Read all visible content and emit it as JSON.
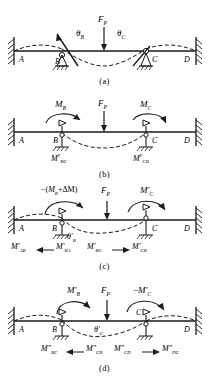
{
  "figure": {
    "stroke_color": "#1a1a1a",
    "dashed_color": "#1a1a1a"
  },
  "panels": [
    {
      "id": "a",
      "caption": "(a)",
      "nodes": [
        "A",
        "B",
        "C",
        "D"
      ],
      "load_label": "F",
      "load_sub": "P",
      "angles": [
        {
          "symbol": "θ",
          "sub": "B"
        },
        {
          "symbol": "θ",
          "sub": "C"
        }
      ],
      "supports": [
        "fixed-wall",
        "roller-pin",
        "roller-pin",
        "fixed-wall"
      ]
    },
    {
      "id": "b",
      "caption": "(b)",
      "nodes": [
        "A",
        "B",
        "C",
        "D"
      ],
      "load_label": "F",
      "load_sub": "P",
      "moments_top": [
        {
          "base": "M",
          "sub": "B"
        },
        {
          "base": "M",
          "sub": "C"
        }
      ],
      "moments_bottom": [
        {
          "base": "M",
          "sub": "BC",
          "sup": "F"
        },
        {
          "base": "M",
          "sub": "CB",
          "sup": "F"
        }
      ],
      "supports": [
        "fixed-wall",
        "clamped-pin",
        "clamped-pin",
        "fixed-wall"
      ]
    },
    {
      "id": "c",
      "caption": "(c)",
      "nodes": [
        "A",
        "B",
        "C",
        "D"
      ],
      "load_label": "F",
      "load_sub": "P",
      "moment_release_label": "−(M",
      "moment_release_sub": "B",
      "moment_release_mid": "+ΔM)",
      "moment_right": {
        "base": "M",
        "prime": "′",
        "sub": "C"
      },
      "angle": {
        "symbol": "θ",
        "prime": "′",
        "sub": "B"
      },
      "moments_bottom": [
        {
          "base": "M",
          "prime": "′",
          "sub": "AB"
        },
        {
          "base": "M",
          "prime": "′",
          "sub": "BA"
        },
        {
          "base": "M",
          "prime": "′",
          "sub": "BC"
        },
        {
          "base": "M",
          "prime": "′",
          "sub": "CB"
        }
      ],
      "arrows_bottom": [
        "left",
        "right"
      ],
      "supports": [
        "fixed-wall",
        "roller-pin",
        "clamped-pin",
        "fixed-wall"
      ]
    },
    {
      "id": "d",
      "caption": "(d)",
      "nodes": [
        "A",
        "B",
        "C",
        "D"
      ],
      "load_label": "F",
      "load_sub": "P",
      "moment_left": {
        "base": "M",
        "prime": "′",
        "sub": "B"
      },
      "moment_right": {
        "neg": "−",
        "base": "M",
        "prime": "′",
        "sub": "C"
      },
      "angle": {
        "symbol": "θ",
        "prime": "′",
        "sub": "C"
      },
      "moments_bottom": [
        {
          "base": "M",
          "sup": "″",
          "sub": "BC"
        },
        {
          "base": "M",
          "sup": "″",
          "sub": "CB"
        },
        {
          "base": "M",
          "sup": "″",
          "sub": "CD"
        },
        {
          "base": "M",
          "sup": "″",
          "sub": "DC"
        }
      ],
      "arrows_bottom": [
        "left",
        "right"
      ],
      "supports": [
        "fixed-wall",
        "clamped-pin",
        "roller-pin",
        "fixed-wall"
      ]
    }
  ]
}
